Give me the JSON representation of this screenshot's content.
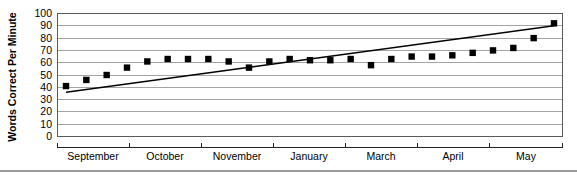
{
  "chart_data": {
    "type": "scatter",
    "title": "",
    "xlabel": "",
    "ylabel": "Words Correct Per Minute",
    "ylim": [
      0,
      100
    ],
    "ytick_step": 10,
    "yticks": [
      "0",
      "10",
      "20",
      "30",
      "40",
      "50",
      "60",
      "70",
      "80",
      "90",
      "100"
    ],
    "grid": true,
    "legend": "none",
    "categories": [
      "September",
      "October",
      "November",
      "January",
      "March",
      "April",
      "May"
    ],
    "xtick_labels": [
      "September",
      "October",
      "November",
      "January",
      "March",
      "April",
      "May"
    ],
    "series": [
      {
        "name": "Words Correct Per Minute",
        "marker": "filled-square",
        "color": "#000000",
        "x": [
          1,
          2,
          3,
          4,
          5,
          6,
          7,
          8,
          9,
          10,
          11,
          12,
          13,
          14,
          15,
          16,
          17,
          18,
          19,
          20,
          21,
          22,
          23,
          24,
          25
        ],
        "values": [
          41,
          46,
          50,
          56,
          61,
          63,
          63,
          63,
          61,
          56,
          61,
          63,
          62,
          62,
          63,
          58,
          63,
          65,
          65,
          66,
          68,
          70,
          72,
          80,
          92
        ]
      },
      {
        "name": "Trend line",
        "type": "linear-fit",
        "color": "#000000",
        "x": [
          1,
          25
        ],
        "values": [
          36,
          90
        ]
      }
    ],
    "annotations": []
  },
  "colors": {
    "gridline": "#8d8d8d",
    "frame": "#5a5a5a",
    "axis": "#222222",
    "marker": "#000000",
    "trend": "#000000",
    "background": "#ffffff"
  }
}
